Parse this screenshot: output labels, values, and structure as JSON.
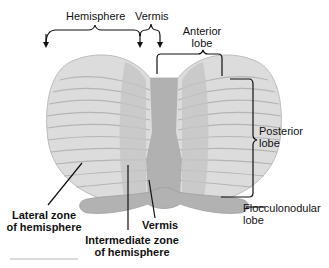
{
  "diagram": {
    "labels": {
      "hemisphere": "Hemisphere",
      "vermis_top": "Vermis",
      "anterior_lobe_line1": "Anterior",
      "anterior_lobe_line2": "lobe",
      "posterior_lobe_line1": "Posterior",
      "posterior_lobe_line2": "lobe",
      "flocculonodular_line1": "Flocculonodular",
      "flocculonodular_line2": "lobe",
      "lateral_zone_line1": "Lateral zone",
      "lateral_zone_line2": "of hemisphere",
      "intermediate_zone_line1": "Intermediate zone",
      "intermediate_zone_line2": "of hemisphere",
      "vermis_bottom": "Vermis"
    },
    "colors": {
      "hemisphere_fill": "#d9d9d9",
      "folia_line": "#b3b3b3",
      "intermediate_fill": "#bdbdbd",
      "vermis_fill": "#a8a8a8",
      "flocculus_fill": "#b0b0b0",
      "text": "#111111"
    }
  }
}
